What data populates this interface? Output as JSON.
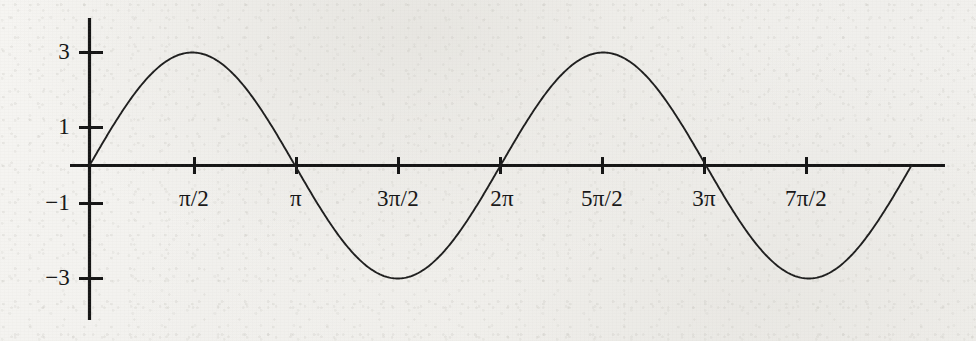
{
  "chart_data": {
    "type": "line",
    "title": "",
    "xlabel": "",
    "ylabel": "",
    "function": "y = 3 sin(x)",
    "amplitude": 3,
    "xlim": [
      0,
      12.566370614359172
    ],
    "ylim": [
      -3.6,
      3.6
    ],
    "grid": false,
    "legend": null,
    "x_ticks": [
      {
        "label": "π/2",
        "value": 1.5707963267948966
      },
      {
        "label": "π",
        "value": 3.141592653589793
      },
      {
        "label": "3π/2",
        "value": 4.71238898038469
      },
      {
        "label": "2π",
        "value": 6.283185307179586
      },
      {
        "label": "5π/2",
        "value": 7.853981633974483
      },
      {
        "label": "3π",
        "value": 9.42477796076938
      },
      {
        "label": "7π/2",
        "value": 10.995574287564276
      }
    ],
    "y_ticks": [
      {
        "label": "3",
        "value": 3
      },
      {
        "label": "1",
        "value": 1
      },
      {
        "label": "−1",
        "value": -1
      },
      {
        "label": "−3",
        "value": -3
      }
    ],
    "series": [
      {
        "name": "3 sin(x)",
        "color": "#1e1e1e",
        "key_points": [
          {
            "x": 0,
            "y": 0,
            "note": "origin"
          },
          {
            "x": 1.5707963267948966,
            "y": 3,
            "note": "maximum"
          },
          {
            "x": 3.141592653589793,
            "y": 0,
            "note": "zero crossing"
          },
          {
            "x": 4.71238898038469,
            "y": -3,
            "note": "minimum"
          },
          {
            "x": 6.283185307179586,
            "y": 0,
            "note": "zero crossing"
          },
          {
            "x": 7.853981633974483,
            "y": 3,
            "note": "maximum"
          },
          {
            "x": 9.42477796076938,
            "y": 0,
            "note": "zero crossing"
          },
          {
            "x": 10.995574287564276,
            "y": -3,
            "note": "minimum"
          },
          {
            "x": 12.566370614359172,
            "y": 0,
            "note": "zero crossing"
          }
        ]
      }
    ]
  },
  "colors": {
    "axis": "#151515",
    "curve": "#1e1e1e",
    "paper": "#f5f4f1",
    "text": "#161616"
  }
}
